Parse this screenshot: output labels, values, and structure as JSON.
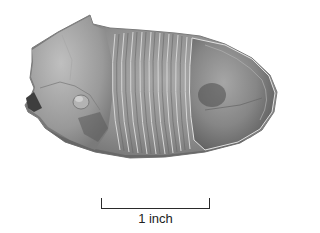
{
  "image": {
    "subject": "trilobite fossil",
    "background": "#ffffff",
    "tones": {
      "light": "#bdbdbd",
      "mid": "#8e8e8e",
      "dark": "#4a4a4a"
    }
  },
  "scale_bar": {
    "label": "1 inch"
  }
}
